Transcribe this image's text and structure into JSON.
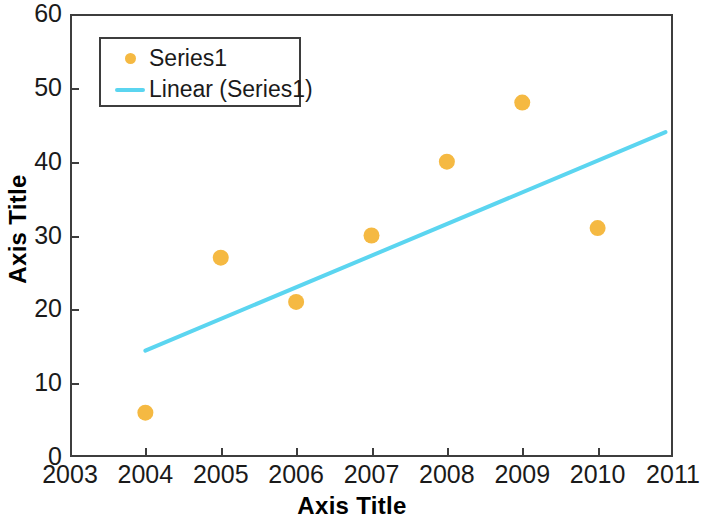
{
  "chart_data": {
    "type": "scatter",
    "title": "",
    "xlabel": "Axis Title",
    "ylabel": "Axis Title",
    "xlim": [
      2003,
      2011
    ],
    "ylim": [
      0,
      60
    ],
    "xticks": [
      "2003",
      "2004",
      "2005",
      "2006",
      "2007",
      "2008",
      "2009",
      "2010",
      "2011"
    ],
    "yticks": [
      "0",
      "10",
      "20",
      "30",
      "40",
      "50",
      "60"
    ],
    "grid": false,
    "legend_position": "top-left",
    "series": [
      {
        "name": "Series1",
        "kind": "scatter",
        "color": "#f5b942",
        "x": [
          2004,
          2005,
          2006,
          2007,
          2008,
          2009,
          2010
        ],
        "values": [
          6,
          27,
          21,
          30,
          40,
          48,
          31
        ]
      },
      {
        "name": "Linear (Series1)",
        "kind": "trendline",
        "color": "#5bd5f0",
        "x": [
          2004.0,
          2010.9
        ],
        "values": [
          14.4,
          44.0
        ]
      }
    ]
  },
  "legend": {
    "entries": [
      {
        "label": "Series1",
        "marker": "circle-marker-icon"
      },
      {
        "label": "Linear (Series1)",
        "marker": "line-swatch-icon"
      }
    ]
  },
  "axes": {
    "x_title": "Axis Title",
    "y_title": "Axis Title"
  }
}
